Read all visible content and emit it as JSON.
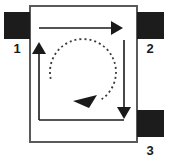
{
  "figure": {
    "type": "schematic-diagram",
    "background_color": "#ffffff",
    "outline_color": "#5a5a5a",
    "pad_color": "#1c1c1c",
    "arrow_color": "#1a1a1a",
    "dashed_arrow_color": "#3a3a3a"
  },
  "body_outline": {
    "name": "device-body",
    "x": 30,
    "y": 6,
    "width": 107,
    "height": 136,
    "fill": "#ffffff",
    "stroke": "#5a5a5a",
    "stroke_width": 2
  },
  "pads": [
    {
      "label": "1",
      "side": "left",
      "x": 4,
      "y": 12,
      "width": 26,
      "height": 27,
      "label_x": 17,
      "label_y": 53
    },
    {
      "label": "2",
      "side": "right",
      "x": 137,
      "y": 12,
      "width": 27,
      "height": 27,
      "label_x": 150,
      "label_y": 53
    },
    {
      "label": "3",
      "side": "right",
      "x": 137,
      "y": 110,
      "width": 27,
      "height": 27,
      "label_x": 150,
      "label_y": 155
    }
  ],
  "solid_arrows": [
    {
      "name": "top-arrow-right",
      "direction": "right",
      "from_x": 39,
      "from_y": 28,
      "to_x": 123,
      "to_y": 28
    },
    {
      "name": "right-arrow-down",
      "direction": "down",
      "from_x": 124,
      "from_y": 40,
      "to_x": 124,
      "to_y": 119
    },
    {
      "name": "bottom-connector",
      "direction": "none",
      "from_x": 39,
      "from_y": 120,
      "to_x": 124,
      "to_y": 120
    },
    {
      "name": "left-arrow-up",
      "direction": "up",
      "from_x": 39,
      "from_y": 120,
      "to_x": 39,
      "to_y": 42
    }
  ],
  "dashed_rotation_arrow": {
    "name": "rotation-arrow",
    "center_x": 83,
    "center_y": 72,
    "radius": 33,
    "rotation_sense": "clockwise",
    "dash_pattern": "2,3",
    "arrowhead_angle_deg": 150,
    "arrowhead_points": "97,95 73,101 89,108"
  }
}
